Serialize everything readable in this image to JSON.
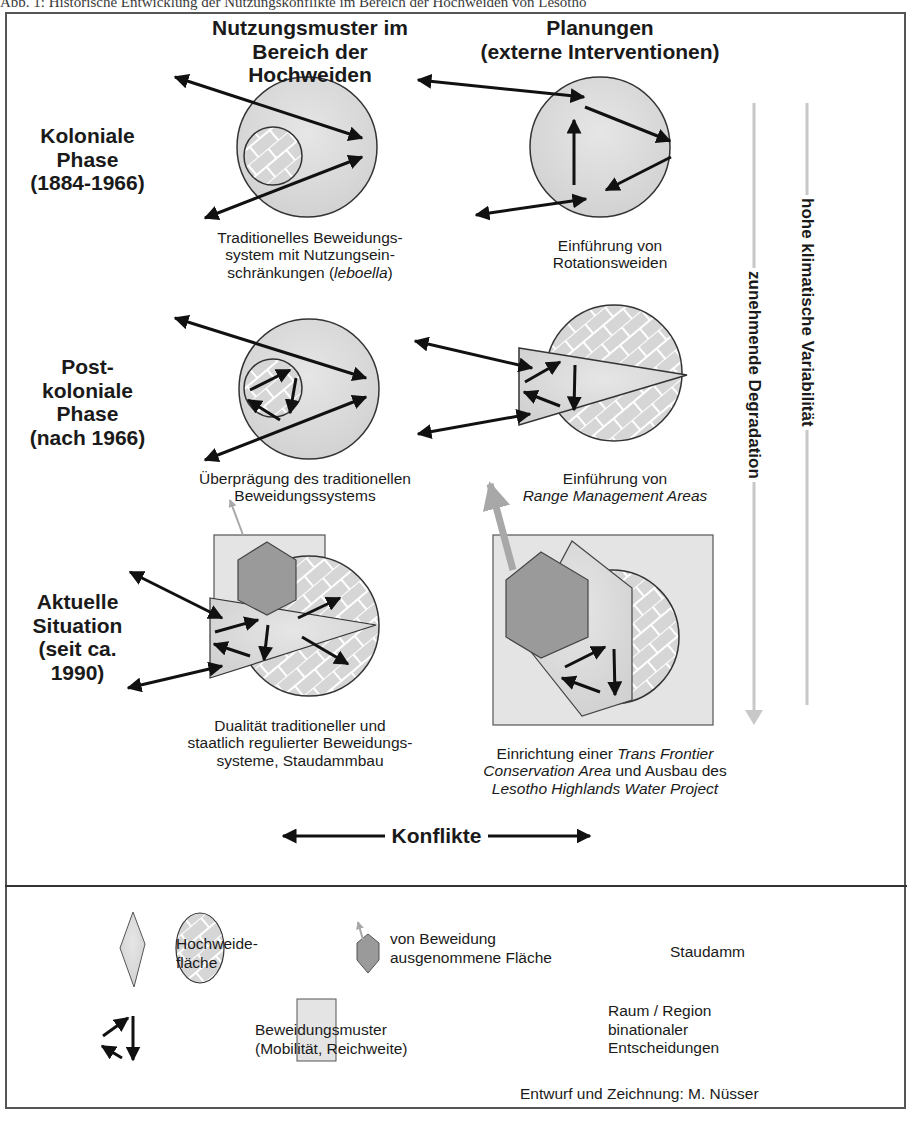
{
  "figure": {
    "caption": "Abb. 1: Historische Entwicklung der Nutzungskonflikte im Bereich der Hochweiden von Lesotho",
    "columns": [
      {
        "line1": "Nutzungsmuster im",
        "line2": "Bereich der Hochweiden"
      },
      {
        "line1": "Planungen",
        "line2": "(externe Interventionen)"
      }
    ],
    "phases": [
      {
        "line1": "Koloniale",
        "line2": "Phase",
        "line3": "(1884-1966)"
      },
      {
        "line1": "Post-",
        "line2": "koloniale",
        "line3": "Phase",
        "line4": "(nach 1966)"
      },
      {
        "line1": "Aktuelle",
        "line2": "Situation",
        "line3": "(seit ca.",
        "line4": "1990)"
      }
    ],
    "descriptions": {
      "r1_left": {
        "line1": "Traditionelles Beweidungs-",
        "line2": "system mit Nutzungsein-",
        "line3a": "schränkungen (",
        "line3i": "leboella",
        "line3b": ")"
      },
      "r1_right": {
        "line1": "Einführung von",
        "line2": "Rotationsweiden"
      },
      "r2_left": {
        "line1": "Überprägung des traditionellen",
        "line2": "Beweidungssystems"
      },
      "r2_right": {
        "line1": "Einführung von",
        "line2i": "Range Management Areas"
      },
      "r3_left": {
        "line1": "Dualität traditioneller und",
        "line2": "staatlich regulierter Beweidungs-",
        "line3": "systeme, Staudammbau"
      },
      "r3_right": {
        "line1a": "Einrichtung einer ",
        "line1i": "Trans Frontier",
        "line2i": "Conservation Area",
        "line2b": " und Ausbau des",
        "line3i": "Lesotho Highlands Water Project"
      }
    },
    "side_arrows": {
      "degradation": "zunehmende Degradation",
      "climate": "hohe klimatische Variabilität"
    },
    "conflict_label": "Konflikte",
    "legend": {
      "hochweide": {
        "line1": "Hochweide-",
        "line2": "fläche"
      },
      "exempt": {
        "line1": "von Beweidung",
        "line2": "ausgenommene Fläche"
      },
      "dam": "Staudamm",
      "grazing": {
        "line1": "Beweidungsmuster",
        "line2": "(Mobilität, Reichweite)"
      },
      "region": {
        "line1": "Raum / Region",
        "line2": "binationaler",
        "line3": "Entscheidungen"
      }
    },
    "credit": "Entwurf und Zeichnung: M. Nüsser",
    "colors": {
      "light_fill": "#dcdcdc",
      "region_fill": "#e4e4e4",
      "dam_fill": "#9a9a9a",
      "dam_arrow": "#a8a8a8",
      "side_line": "#c8c8c8",
      "stroke": "#222222"
    }
  }
}
